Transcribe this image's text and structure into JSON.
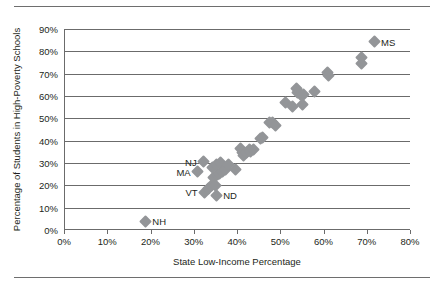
{
  "chart_data": {
    "type": "scatter",
    "title": "",
    "xlabel": "State Low-Income Percentage",
    "ylabel": "Percentage of Students in High-Poverty Schools",
    "xlim": [
      0,
      80
    ],
    "ylim": [
      0,
      90
    ],
    "xticks": [
      "0%",
      "10%",
      "20%",
      "30%",
      "40%",
      "50%",
      "60%",
      "70%",
      "80%"
    ],
    "xtick_values": [
      0,
      10,
      20,
      30,
      40,
      50,
      60,
      70,
      80
    ],
    "yticks": [
      "0%",
      "10%",
      "20%",
      "30%",
      "40%",
      "50%",
      "60%",
      "70%",
      "80%",
      "90%"
    ],
    "ytick_values": [
      0,
      10,
      20,
      30,
      40,
      50,
      60,
      70,
      80,
      90
    ],
    "grid": "horizontal",
    "legend": "none",
    "marker": "diamond",
    "marker_color": "#939598",
    "points": [
      {
        "x": 18.8,
        "y": 4.0,
        "label": "NH",
        "label_side": "right"
      },
      {
        "x": 32.5,
        "y": 17.0,
        "label": "VT",
        "label_side": "left"
      },
      {
        "x": 35.2,
        "y": 15.5,
        "label": "ND",
        "label_side": "right"
      },
      {
        "x": 30.9,
        "y": 26.0,
        "label": "MA",
        "label_side": "left"
      },
      {
        "x": 32.3,
        "y": 30.5,
        "label": "NJ",
        "label_side": "left"
      },
      {
        "x": 71.7,
        "y": 84.3,
        "label": "MS",
        "label_side": "right"
      },
      {
        "x": 33.4,
        "y": 18.6,
        "label": "",
        "label_side": ""
      },
      {
        "x": 34.2,
        "y": 20.0,
        "label": "",
        "label_side": ""
      },
      {
        "x": 34.6,
        "y": 23.6,
        "label": "",
        "label_side": ""
      },
      {
        "x": 35.1,
        "y": 19.9,
        "label": "",
        "label_side": ""
      },
      {
        "x": 35.4,
        "y": 24.7,
        "label": "",
        "label_side": ""
      },
      {
        "x": 36.0,
        "y": 25.5,
        "label": "",
        "label_side": ""
      },
      {
        "x": 34.3,
        "y": 28.0,
        "label": "",
        "label_side": ""
      },
      {
        "x": 35.3,
        "y": 29.2,
        "label": "",
        "label_side": ""
      },
      {
        "x": 36.2,
        "y": 30.3,
        "label": "",
        "label_side": ""
      },
      {
        "x": 36.6,
        "y": 26.3,
        "label": "",
        "label_side": ""
      },
      {
        "x": 37.4,
        "y": 27.1,
        "label": "",
        "label_side": ""
      },
      {
        "x": 38.1,
        "y": 29.2,
        "label": "",
        "label_side": ""
      },
      {
        "x": 39.6,
        "y": 27.0,
        "label": "",
        "label_side": ""
      },
      {
        "x": 40.7,
        "y": 36.4,
        "label": "",
        "label_side": ""
      },
      {
        "x": 41.2,
        "y": 34.5,
        "label": "",
        "label_side": ""
      },
      {
        "x": 41.6,
        "y": 33.4,
        "label": "",
        "label_side": ""
      },
      {
        "x": 42.1,
        "y": 34.6,
        "label": "",
        "label_side": ""
      },
      {
        "x": 42.8,
        "y": 36.2,
        "label": "",
        "label_side": ""
      },
      {
        "x": 43.2,
        "y": 35.3,
        "label": "",
        "label_side": ""
      },
      {
        "x": 43.7,
        "y": 36.1,
        "label": "",
        "label_side": ""
      },
      {
        "x": 45.4,
        "y": 41.0,
        "label": "",
        "label_side": ""
      },
      {
        "x": 46.0,
        "y": 41.2,
        "label": "",
        "label_side": ""
      },
      {
        "x": 47.6,
        "y": 48.2,
        "label": "",
        "label_side": ""
      },
      {
        "x": 48.3,
        "y": 48.1,
        "label": "",
        "label_side": ""
      },
      {
        "x": 48.9,
        "y": 46.9,
        "label": "",
        "label_side": ""
      },
      {
        "x": 51.1,
        "y": 57.2,
        "label": "",
        "label_side": ""
      },
      {
        "x": 52.9,
        "y": 55.3,
        "label": "",
        "label_side": ""
      },
      {
        "x": 53.8,
        "y": 63.2,
        "label": "",
        "label_side": ""
      },
      {
        "x": 54.1,
        "y": 61.5,
        "label": "",
        "label_side": ""
      },
      {
        "x": 54.6,
        "y": 60.6,
        "label": "",
        "label_side": ""
      },
      {
        "x": 55.1,
        "y": 56.0,
        "label": "",
        "label_side": ""
      },
      {
        "x": 55.4,
        "y": 60.8,
        "label": "",
        "label_side": ""
      },
      {
        "x": 57.9,
        "y": 62.1,
        "label": "",
        "label_side": ""
      },
      {
        "x": 60.9,
        "y": 70.5,
        "label": "",
        "label_side": ""
      },
      {
        "x": 61.1,
        "y": 69.3,
        "label": "",
        "label_side": ""
      },
      {
        "x": 68.7,
        "y": 77.4,
        "label": "",
        "label_side": ""
      },
      {
        "x": 68.8,
        "y": 74.4,
        "label": "",
        "label_side": ""
      }
    ]
  }
}
